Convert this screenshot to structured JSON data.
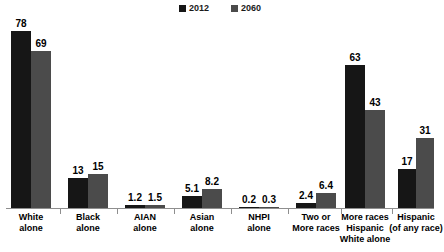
{
  "legend": {
    "items": [
      {
        "label": "2012",
        "color": "#161616",
        "icon": "square-marker-icon"
      },
      {
        "label": "2060",
        "color": "#4b4b4b",
        "icon": "square-marker-icon"
      }
    ]
  },
  "chart_data": {
    "type": "bar",
    "title": "",
    "subtitle": "",
    "xlabel": "",
    "ylabel": "",
    "ylim": [
      0,
      80
    ],
    "grid": false,
    "legend_position": "top-center",
    "categories": [
      "White alone",
      "Black alone",
      "AIAN alone",
      "Asian alone",
      "NHPI alone",
      "Two or More races",
      "More races Hispanic White alone",
      "Hispanic (of any race)"
    ],
    "category_lines": [
      [
        "White",
        "alone"
      ],
      [
        "Black",
        "alone"
      ],
      [
        "AIAN",
        "alone"
      ],
      [
        "Asian",
        "alone"
      ],
      [
        "NHPI",
        "alone"
      ],
      [
        "Two or",
        "More races"
      ],
      [
        "More races",
        "Hispanic",
        "White alone"
      ],
      [
        "Hispanic",
        "(of any race)"
      ]
    ],
    "series": [
      {
        "name": "2012",
        "color": "#161616",
        "values": [
          78,
          13,
          1.2,
          5.1,
          0.2,
          2.4,
          63,
          17
        ]
      },
      {
        "name": "2060",
        "color": "#4b4b4b",
        "values": [
          69,
          15,
          1.5,
          8.2,
          0.3,
          6.4,
          43,
          31
        ]
      }
    ],
    "value_labels": {
      "2012": [
        "78",
        "13",
        "1.2",
        "5.1",
        "0.2",
        "2.4",
        "63",
        "17"
      ],
      "2060": [
        "69",
        "15",
        "1.5",
        "8.2",
        "0.3",
        "6.4",
        "43",
        "31"
      ]
    }
  }
}
